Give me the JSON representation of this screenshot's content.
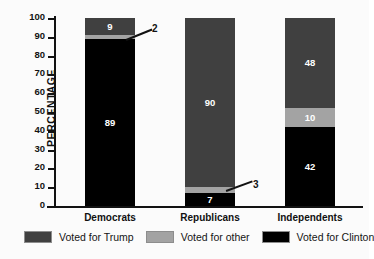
{
  "chart_data": {
    "type": "bar",
    "subtype": "stacked-vertical-100",
    "title": "",
    "xlabel": "",
    "ylabel": "PERCENTAGE",
    "ylim": [
      0,
      100
    ],
    "ytick_step": 10,
    "yticks": [
      0,
      10,
      20,
      30,
      40,
      50,
      60,
      70,
      80,
      90,
      100
    ],
    "grid": false,
    "legend_position": "bottom",
    "categories": [
      "Democrats",
      "Republicans",
      "Independents"
    ],
    "series": [
      {
        "name": "Voted for Clinton",
        "color": "#000000",
        "values": [
          89,
          7,
          42
        ]
      },
      {
        "name": "Voted for other",
        "color": "#a3a3a3",
        "values": [
          2,
          3,
          10
        ]
      },
      {
        "name": "Voted for Trump",
        "color": "#404040",
        "values": [
          9,
          90,
          48
        ]
      }
    ],
    "callouts": [
      {
        "label": "2",
        "category": "Democrats",
        "series": "Voted for other"
      },
      {
        "label": "3",
        "category": "Republicans",
        "series": "Voted for other"
      }
    ]
  },
  "legend": {
    "items": [
      {
        "label": "Voted for Trump",
        "color": "#404040"
      },
      {
        "label": "Voted for other",
        "color": "#a3a3a3"
      },
      {
        "label": "Voted for Clinton",
        "color": "#000000"
      }
    ]
  },
  "axis": {
    "y_label": "PERCENTAGE",
    "y_ticks": [
      "100",
      "90",
      "80",
      "70",
      "60",
      "50",
      "40",
      "30",
      "20",
      "10",
      "0"
    ]
  },
  "bars": {
    "democrats": {
      "category": "Democrats",
      "trump": "9",
      "other": "2",
      "clinton": "89"
    },
    "republicans": {
      "category": "Republicans",
      "trump": "90",
      "other": "3",
      "clinton": "7"
    },
    "independents": {
      "category": "Independents",
      "trump": "48",
      "other": "10",
      "clinton": "42"
    }
  },
  "callout_labels": {
    "democrats_other": "2",
    "republicans_other": "3"
  },
  "colors": {
    "trump": "#404040",
    "other": "#a3a3a3",
    "clinton": "#000000",
    "axis": "#121212",
    "background": "#fbfbfb"
  }
}
